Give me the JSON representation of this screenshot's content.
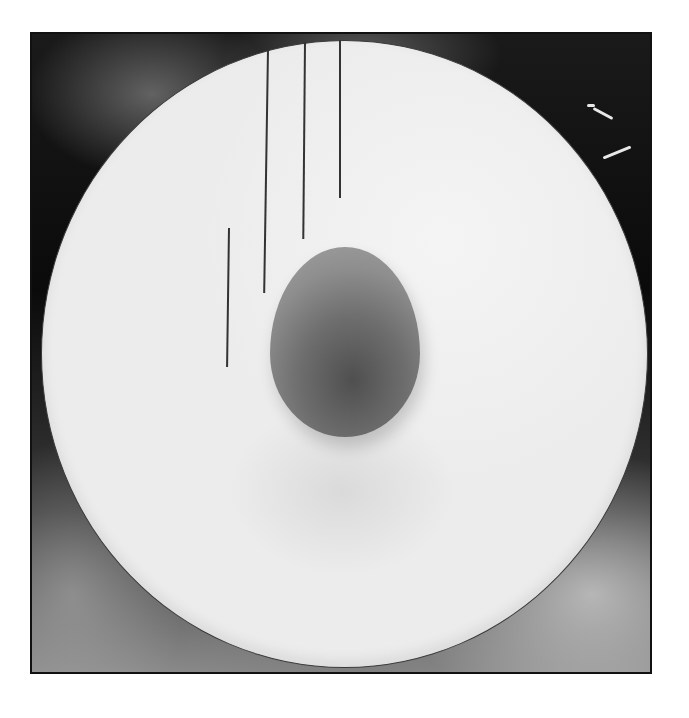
{
  "scene": {
    "subject": "egg on white plate",
    "background": "dark textured surface",
    "colors": {
      "page_background": "#ffffff",
      "frame_dark": "#0a0a0a",
      "plate": "#ececec",
      "plate_rim": "#3a3a3a",
      "egg_dark": "#4f4f4f",
      "egg_light": "#9a9a9a",
      "lines": "#333333"
    },
    "vertical_lines": [
      {
        "x": 229,
        "top": 228,
        "bottom": 367
      },
      {
        "x": 268,
        "top": 50,
        "bottom": 293
      },
      {
        "x": 305,
        "top": 42,
        "bottom": 239
      },
      {
        "x": 340,
        "top": 40,
        "bottom": 198
      }
    ]
  }
}
